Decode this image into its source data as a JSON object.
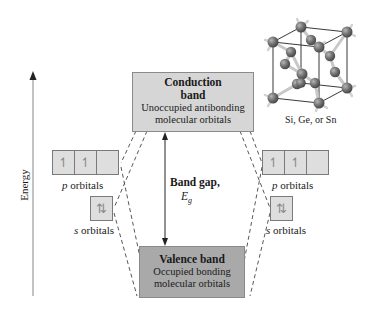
{
  "figure": {
    "axis": {
      "label": "Energy"
    },
    "conduction_band": {
      "title": "Conduction band",
      "title_line1": "Conduction",
      "title_line2": "band",
      "description_line1": "Unoccupied antibonding",
      "description_line2": "molecular orbitals",
      "fill": "#d6d6d6"
    },
    "valence_band": {
      "title": "Valence band",
      "description_line1": "Occupied bonding",
      "description_line2": "molecular orbitals",
      "fill": "#a9a9a9"
    },
    "band_gap": {
      "label": "Band gap,",
      "symbol": "E",
      "subscript": "g"
    },
    "left_atom": {
      "p_orbitals": {
        "label_letter": "p",
        "label_rest": " orbitals",
        "cells": [
          "↿",
          "↿",
          ""
        ]
      },
      "s_orbitals": {
        "label_letter": "s",
        "label_rest": " orbitals",
        "cells": [
          "⇅"
        ]
      }
    },
    "right_atom": {
      "p_orbitals": {
        "label_letter": "p",
        "label_rest": " orbitals",
        "cells": [
          "↿",
          "↿",
          ""
        ]
      },
      "s_orbitals": {
        "label_letter": "s",
        "label_rest": " orbitals",
        "cells": [
          "⇅"
        ]
      }
    },
    "crystal": {
      "caption": "Si, Ge, or Sn",
      "icon": "diamond-cubic-lattice-icon"
    }
  }
}
